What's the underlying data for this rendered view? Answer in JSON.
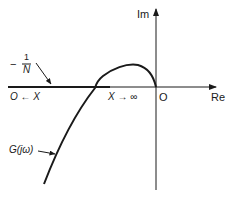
{
  "diagram": {
    "axes": {
      "imag_label": "Im",
      "real_label": "Re",
      "origin_label": "O"
    },
    "labels": {
      "neg_inv_n_sign": "−",
      "neg_inv_n_num": "1",
      "neg_inv_n_den": "N",
      "left_limit": "O ← X",
      "right_limit": "X → ∞",
      "g_label": "G(jω)"
    },
    "colors": {
      "stroke": "#1a1a1a",
      "background": "#ffffff"
    }
  }
}
